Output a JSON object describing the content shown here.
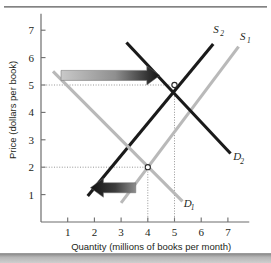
{
  "chart_data": {
    "type": "line",
    "title": "",
    "xlabel": "Quantity (millions of books per month)",
    "ylabel": "Price (dollars per book)",
    "xlim": [
      0,
      7.8
    ],
    "ylim": [
      0,
      7.6
    ],
    "xticks": [
      1,
      2,
      3,
      4,
      5,
      6,
      7
    ],
    "yticks": [
      1,
      2,
      3,
      4,
      5,
      6,
      7
    ],
    "grid": false,
    "legend_position": "inline-curve-labels",
    "series": [
      {
        "name": "S1",
        "label": "S",
        "subscript": "1",
        "role": "supply-original",
        "color": "#b9b9b9",
        "x": [
          3.0,
          7.4
        ],
        "y": [
          0.7,
          6.4
        ],
        "label_x": 7.45,
        "label_y": 6.65
      },
      {
        "name": "S2",
        "label": "S",
        "subscript": "2",
        "role": "supply-new",
        "color": "#1a1a1a",
        "x": [
          1.75,
          6.45
        ],
        "y": [
          0.95,
          6.5
        ],
        "label_x": 6.45,
        "label_y": 6.9
      },
      {
        "name": "D1",
        "label": "D",
        "subscript": "1",
        "role": "demand-original",
        "color": "#b9b9b9",
        "x": [
          0.45,
          5.3
        ],
        "y": [
          5.5,
          0.75
        ],
        "label_x": 5.35,
        "label_y": 0.55
      },
      {
        "name": "D2",
        "label": "D",
        "subscript": "2",
        "role": "demand-shifted",
        "color": "#1a1a1a",
        "x": [
          3.2,
          7.1
        ],
        "y": [
          6.55,
          2.5
        ],
        "label_x": 7.2,
        "label_y": 2.25
      }
    ],
    "equilibria": [
      {
        "name": "original-equilibrium",
        "x": 4,
        "y": 2
      },
      {
        "name": "new-equilibrium",
        "x": 5,
        "y": 5
      }
    ],
    "guide_lines": [
      {
        "name": "price-guide-5",
        "type": "horizontal",
        "value": 5,
        "to_x": 5
      },
      {
        "name": "price-guide-2",
        "type": "horizontal",
        "value": 2,
        "to_x": 4
      },
      {
        "name": "quantity-guide-5",
        "type": "vertical",
        "value": 5,
        "to_y": 5
      },
      {
        "name": "quantity-guide-4",
        "type": "vertical",
        "value": 4,
        "to_y": 2
      }
    ],
    "annotations": [
      {
        "name": "price-increase-arrow",
        "direction": "right",
        "meaning": "price rises",
        "x_start": 0.75,
        "x_end": 4.45,
        "y": 5.35,
        "gradient_from": "#c9c9c9",
        "gradient_to": "#111111"
      },
      {
        "name": "quantity-decrease-arrow",
        "direction": "left",
        "meaning": "quantity shifts left",
        "x_start": 3.55,
        "x_end": 1.85,
        "y": 1.25,
        "gradient_from": "#111111",
        "gradient_to": "#8d8d8d"
      }
    ]
  },
  "colors": {
    "axis": "#6d6d6d",
    "dark_curve": "#1a1a1a",
    "light_curve": "#b9b9b9",
    "text": "#231f20",
    "rule": "#8c8c8c"
  }
}
